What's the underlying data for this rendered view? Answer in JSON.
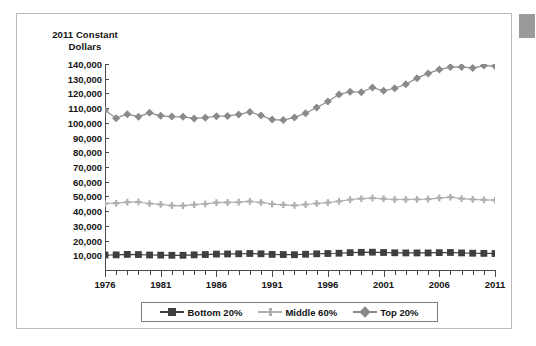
{
  "chart_data": {
    "type": "line",
    "title": "",
    "subtitle": "",
    "ylabel": "2011 Constant Dollars",
    "xlabel": "",
    "grid": false,
    "legend_position": "bottom",
    "xlim": [
      1976,
      2011
    ],
    "ylim": [
      0,
      140000
    ],
    "y_ticks": [
      10000,
      20000,
      30000,
      40000,
      50000,
      60000,
      70000,
      80000,
      90000,
      100000,
      110000,
      120000,
      130000,
      140000
    ],
    "y_tick_labels": [
      "10,000",
      "20,000",
      "30,000",
      "40,000",
      "50,000",
      "60,000",
      "70,000",
      "80,000",
      "90,000",
      "100,000",
      "110,000",
      "120,000",
      "130,000",
      "140,000"
    ],
    "x_tick_labels": [
      "1976",
      "1981",
      "1986",
      "1991",
      "1996",
      "2001",
      "2006",
      "2011"
    ],
    "x_tick_values": [
      1976,
      1981,
      1986,
      1991,
      1996,
      2001,
      2006,
      2011
    ],
    "x": [
      1976,
      1977,
      1978,
      1979,
      1980,
      1981,
      1982,
      1983,
      1984,
      1985,
      1986,
      1987,
      1988,
      1989,
      1990,
      1991,
      1992,
      1993,
      1994,
      1995,
      1996,
      1997,
      1998,
      1999,
      2000,
      2001,
      2002,
      2003,
      2004,
      2005,
      2006,
      2007,
      2008,
      2009,
      2010,
      2011
    ],
    "series": [
      {
        "name": "Bottom 20%",
        "color": "#3f3f3f",
        "marker": "square",
        "values": [
          10200,
          10300,
          10600,
          10500,
          10200,
          10100,
          10000,
          10000,
          10300,
          10500,
          10800,
          10900,
          11000,
          11200,
          11000,
          10600,
          10500,
          10400,
          10700,
          11000,
          11200,
          11400,
          11800,
          12000,
          12100,
          11900,
          11700,
          11600,
          11600,
          11600,
          11800,
          11900,
          11600,
          11400,
          11300,
          11200
        ]
      },
      {
        "name": "Middle 60%",
        "color": "#b0b0b0",
        "marker": "plus",
        "values": [
          45200,
          45400,
          46100,
          46200,
          45100,
          44600,
          43800,
          43700,
          44400,
          44900,
          45800,
          45900,
          46100,
          46600,
          45900,
          44800,
          44300,
          43900,
          44500,
          45200,
          45800,
          46700,
          47800,
          48500,
          48900,
          48400,
          47900,
          47900,
          48000,
          48200,
          48900,
          49500,
          48500,
          48000,
          47700,
          47500
        ]
      },
      {
        "name": "Top 20%",
        "color": "#8a8a8a",
        "marker": "diamond",
        "values": [
          108500,
          103200,
          105900,
          104200,
          106800,
          104800,
          104300,
          104100,
          103000,
          103500,
          104500,
          104700,
          105700,
          107400,
          105000,
          102200,
          101900,
          103700,
          106500,
          110400,
          114500,
          119300,
          121200,
          120800,
          124000,
          121800,
          123500,
          126200,
          130400,
          133600,
          136200,
          137900,
          138000,
          137200,
          138900,
          138600
        ]
      }
    ]
  },
  "legend": {
    "items": [
      {
        "label": "Bottom 20%",
        "color": "#3f3f3f",
        "marker": "square"
      },
      {
        "label": "Middle 60%",
        "color": "#b0b0b0",
        "marker": "plus"
      },
      {
        "label": "Top 20%",
        "color": "#8a8a8a",
        "marker": "diamond"
      }
    ]
  },
  "axis_caption": {
    "line1": "2011 Constant",
    "line2": "Dollars"
  }
}
